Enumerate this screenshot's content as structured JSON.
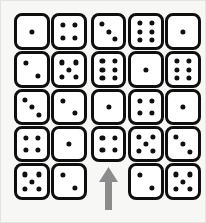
{
  "puzzle": {
    "title": "Dice grid puzzle",
    "background_color": "#f7f7f5",
    "die_face_color": "#ffffff",
    "die_border_color": "#100f0f",
    "pip_color": "#100f0f",
    "arrow_color": "#8c8c8c",
    "grid": {
      "rows": 5,
      "columns": 5,
      "cells": [
        [
          {
            "type": "die",
            "value": 1
          },
          {
            "type": "die",
            "value": 4
          },
          {
            "type": "die",
            "value": 3
          },
          {
            "type": "die",
            "value": 6
          },
          {
            "type": "die",
            "value": 1
          }
        ],
        [
          {
            "type": "die",
            "value": 2
          },
          {
            "type": "die",
            "value": 5
          },
          {
            "type": "die",
            "value": 6
          },
          {
            "type": "die",
            "value": 1
          },
          {
            "type": "die",
            "value": 6
          }
        ],
        [
          {
            "type": "die",
            "value": 3
          },
          {
            "type": "die",
            "value": 2
          },
          {
            "type": "die",
            "value": 1
          },
          {
            "type": "die",
            "value": 4
          },
          {
            "type": "die",
            "value": 1
          }
        ],
        [
          {
            "type": "die",
            "value": 4
          },
          {
            "type": "die",
            "value": 1
          },
          {
            "type": "die",
            "value": 4
          },
          {
            "type": "die",
            "value": 5
          },
          {
            "type": "die",
            "value": 3
          }
        ],
        [
          {
            "type": "die",
            "value": 5
          },
          {
            "type": "die",
            "value": 2
          },
          {
            "type": "empty"
          },
          {
            "type": "die",
            "value": 2
          },
          {
            "type": "die",
            "value": 5
          }
        ]
      ]
    },
    "arrow": {
      "direction": "up",
      "points_at_column": 3,
      "color": "#8c8c8c"
    }
  }
}
